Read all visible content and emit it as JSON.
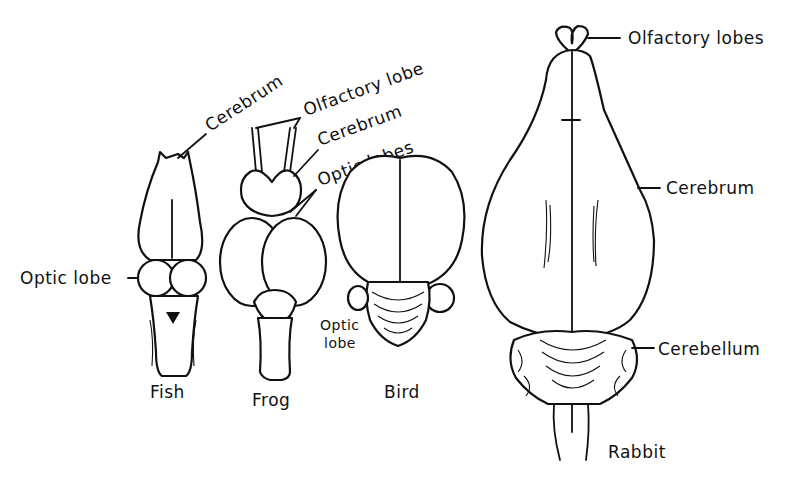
{
  "figure": {
    "specimens": [
      {
        "name": "Fish",
        "labels": [
          "Cerebrum",
          "Optic lobe"
        ]
      },
      {
        "name": "Frog",
        "labels": [
          "Olfactory lobe",
          "Cerebrum",
          "Optic lobes"
        ]
      },
      {
        "name": "Bird",
        "labels": [
          "Optic lobe"
        ]
      },
      {
        "name": "Rabbit",
        "labels": [
          "Olfactory lobes",
          "Cerebrum",
          "Cerebellum"
        ]
      }
    ]
  },
  "labels": {
    "fish_cerebrum": "Cerebrum",
    "fish_optic_lobe": "Optic lobe",
    "frog_olfactory_lobe": "Olfactory lobe",
    "frog_cerebrum": "Cerebrum",
    "frog_optic_lobes": "Optic lobes",
    "bird_optic_1": "Optic",
    "bird_optic_2": "lobe",
    "rabbit_olfactory_lobes": "Olfactory lobes",
    "rabbit_cerebrum": "Cerebrum",
    "rabbit_cerebellum": "Cerebellum"
  },
  "captions": {
    "fish": "Fish",
    "frog": "Frog",
    "bird": "Bird",
    "rabbit": "Rabbit"
  }
}
